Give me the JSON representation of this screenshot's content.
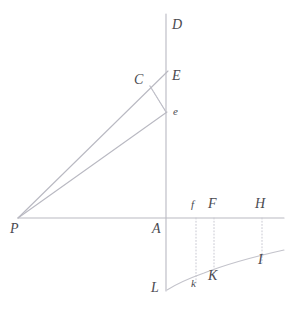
{
  "figure": {
    "caption": "",
    "width": 291,
    "height": 310,
    "background": "#ffffff",
    "line_color": "#b9b9c2",
    "curve_color": "#c3c3cb",
    "dotted_color": "#c9c9d2",
    "label_color": "#4a4a50"
  },
  "axes": {
    "vertical": {
      "name": "vertical-axis",
      "x": 166,
      "y_top": 14,
      "y_bottom": 291,
      "top_label": "D",
      "origin_label": "A",
      "bottom_label": "L"
    },
    "horizontal": {
      "name": "horizontal-axis",
      "y": 218,
      "x_left": 18,
      "x_right": 284,
      "left_label": "P"
    }
  },
  "points": [
    {
      "id": "D",
      "label": "D",
      "x": 166,
      "y": 14,
      "label_x": 172,
      "label_y": 18,
      "size": "cap"
    },
    {
      "id": "E",
      "label": "E",
      "x": 166,
      "y": 76,
      "label_x": 172,
      "label_y": 69,
      "size": "cap"
    },
    {
      "id": "C",
      "label": "C",
      "x": 150,
      "y": 86,
      "label_x": 134,
      "label_y": 73,
      "size": "cap"
    },
    {
      "id": "e",
      "label": "e",
      "x": 166,
      "y": 112,
      "label_x": 173,
      "label_y": 106,
      "size": "small"
    },
    {
      "id": "P",
      "label": "P",
      "x": 18,
      "y": 218,
      "label_x": 10,
      "label_y": 222,
      "size": "cap"
    },
    {
      "id": "A",
      "label": "A",
      "x": 166,
      "y": 218,
      "label_x": 152,
      "label_y": 222,
      "size": "cap"
    },
    {
      "id": "f",
      "label": "f",
      "x": 196,
      "y": 218,
      "label_x": 191,
      "label_y": 199,
      "size": "small"
    },
    {
      "id": "F",
      "label": "F",
      "x": 214,
      "y": 218,
      "label_x": 208,
      "label_y": 197,
      "size": "cap"
    },
    {
      "id": "H",
      "label": "H",
      "x": 262,
      "y": 218,
      "label_x": 255,
      "label_y": 197,
      "size": "cap"
    },
    {
      "id": "L",
      "label": "L",
      "x": 166,
      "y": 291,
      "label_x": 151,
      "label_y": 281,
      "size": "cap"
    },
    {
      "id": "k",
      "label": "k",
      "x": 196,
      "y": 283,
      "label_x": 191,
      "label_y": 278,
      "size": "small"
    },
    {
      "id": "K",
      "label": "K",
      "x": 214,
      "y": 278,
      "label_x": 208,
      "label_y": 269,
      "size": "cap"
    },
    {
      "id": "I",
      "label": "I",
      "x": 262,
      "y": 262,
      "label_x": 258,
      "label_y": 253,
      "size": "cap"
    }
  ],
  "solid_lines": [
    {
      "name": "ray-p-to-e-upper",
      "x1": 18,
      "y1": 218,
      "x2": 168,
      "y2": 71
    },
    {
      "name": "ray-p-to-e-lower",
      "x1": 18,
      "y1": 218,
      "x2": 167,
      "y2": 112
    },
    {
      "name": "segment-c-to-e",
      "x1": 150,
      "y1": 86,
      "x2": 166,
      "y2": 112
    }
  ],
  "dotted_lines": [
    {
      "name": "segment-c-to-e-dotted",
      "x1": 150,
      "y1": 86,
      "x2": 166,
      "y2": 112
    },
    {
      "name": "drop-line-f-to-k",
      "x1": 196,
      "y1": 218,
      "x2": 196,
      "y2": 284
    },
    {
      "name": "drop-line-F-to-K",
      "x1": 214,
      "y1": 218,
      "x2": 214,
      "y2": 279
    },
    {
      "name": "drop-line-H-to-I",
      "x1": 262,
      "y1": 218,
      "x2": 262,
      "y2": 263
    }
  ],
  "curve": {
    "name": "hyperbolic-curve-L-k-K-I",
    "path": "M 167 290 C 178 283 190 278 204 273 C 222 266 248 258 284 250",
    "start_label": "L",
    "end_label": "I"
  },
  "chart_data": {
    "type": "line",
    "title": "",
    "xlabel": "",
    "ylabel": "",
    "axis_points": [
      "P",
      "A",
      "f",
      "F",
      "H"
    ],
    "curve_points": [
      "L",
      "k",
      "K",
      "I"
    ],
    "ray_points": [
      "P",
      "C",
      "E",
      "e",
      "D"
    ],
    "grid": false
  }
}
